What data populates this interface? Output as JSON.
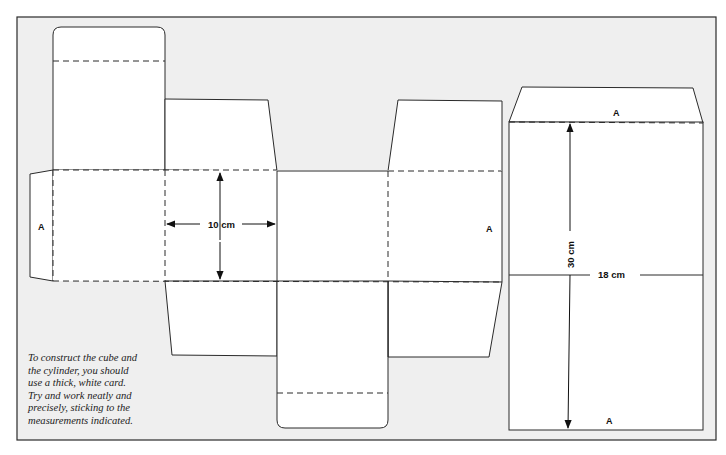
{
  "diagram": {
    "colors": {
      "background_panel": "#efefef",
      "card": "#ffffff",
      "line": "#2a2a2a"
    },
    "cube_net": {
      "glue_label_left": "A",
      "glue_label_right": "A",
      "width_dimension": "10 cm"
    },
    "cylinder_net": {
      "top_label": "A",
      "bottom_label": "A",
      "height_dimension": "30 cm",
      "width_dimension": "18 cm"
    },
    "caption": {
      "lines": [
        "To construct the cube and",
        "the cylinder, you should",
        "use a thick, white card.",
        "Try and work neatly and",
        "precisely, sticking to the",
        "measurements indicated."
      ]
    }
  }
}
